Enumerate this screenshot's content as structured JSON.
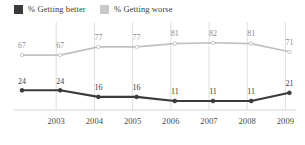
{
  "legend": {
    "entries": [
      {
        "label": "% Getting better",
        "color": "#3a3a3a",
        "swatch_name": "legend-swatch-better"
      },
      {
        "label": "% Getting worse",
        "color": "#c9c9c9",
        "swatch_name": "legend-swatch-worse"
      }
    ]
  },
  "axis": {
    "x_ticks": [
      "2003",
      "2004",
      "2005",
      "2006",
      "2007",
      "2008",
      "2009"
    ]
  },
  "colors": {
    "better_line": "#3a3a3a",
    "worse_line": "#c1c1c1",
    "gridline": "#d8d8d8",
    "baseline": "#cfcfcf",
    "background": "#ffffff",
    "label_dark": "#3c3c3c",
    "label_gray": "#8e8e8e"
  },
  "chart_data": {
    "type": "line",
    "title": "",
    "subtitle": "",
    "xlabel": "",
    "ylabel": "",
    "ylim": [
      0,
      100
    ],
    "grid": "vertical",
    "legend_position": "top-left",
    "categories": [
      "",
      "2003",
      "2004",
      "2005",
      "2006",
      "2007",
      "2008",
      "2009"
    ],
    "x_tick_labels": [
      "2003",
      "2004",
      "2005",
      "2006",
      "2007",
      "2008",
      "2009"
    ],
    "series": [
      {
        "name": "% Getting worse",
        "color": "#c1c1c1",
        "values": [
          67,
          67,
          77,
          77,
          81,
          82,
          81,
          71
        ],
        "labels": [
          "67",
          "67",
          "77",
          "77",
          "81",
          "82",
          "81",
          "71"
        ]
      },
      {
        "name": "% Getting better",
        "color": "#3a3a3a",
        "values": [
          24,
          24,
          16,
          16,
          11,
          11,
          11,
          21
        ],
        "labels": [
          "24",
          "24",
          "16",
          "16",
          "11",
          "11",
          "11",
          "21"
        ]
      }
    ]
  }
}
